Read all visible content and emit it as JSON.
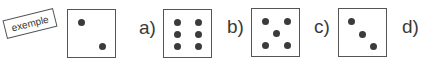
{
  "example": {
    "tag_label": "exemple",
    "dots": [
      [
        13,
        12
      ],
      [
        34,
        36
      ]
    ]
  },
  "items": [
    {
      "label": "a)",
      "dots": [
        [
          12,
          12
        ],
        [
          34,
          12
        ],
        [
          12,
          25
        ],
        [
          34,
          25
        ],
        [
          12,
          38
        ],
        [
          34,
          38
        ]
      ]
    },
    {
      "label": "b)",
      "dots": [
        [
          12,
          12
        ],
        [
          35,
          12
        ],
        [
          23,
          25
        ],
        [
          12,
          37
        ],
        [
          35,
          37
        ]
      ]
    },
    {
      "label": "c)",
      "dots": [
        [
          11,
          12
        ],
        [
          22,
          25
        ],
        [
          34,
          36
        ]
      ]
    },
    {
      "label": "d)",
      "dots": []
    }
  ]
}
